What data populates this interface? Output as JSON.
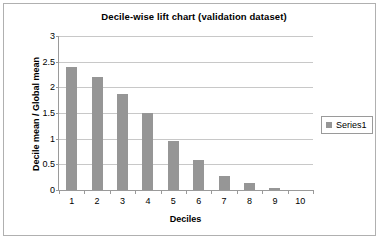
{
  "chart_data": {
    "type": "bar",
    "title": "Decile-wise lift chart (validation dataset)",
    "xlabel": "Deciles",
    "ylabel": "Decile mean / Global mean",
    "categories": [
      "1",
      "2",
      "3",
      "4",
      "5",
      "6",
      "7",
      "8",
      "9",
      "10"
    ],
    "values": [
      2.4,
      2.2,
      1.87,
      1.5,
      0.95,
      0.58,
      0.27,
      0.13,
      0.04,
      0.0
    ],
    "series": [
      {
        "name": "Series1",
        "values": [
          2.4,
          2.2,
          1.87,
          1.5,
          0.95,
          0.58,
          0.27,
          0.13,
          0.04,
          0.0
        ]
      }
    ],
    "ylim": [
      0,
      3
    ],
    "y_ticks": [
      "0",
      "0.5",
      "1",
      "1.5",
      "2",
      "2.5",
      "3"
    ],
    "y_tick_values": [
      0,
      0.5,
      1,
      1.5,
      2,
      2.5,
      3
    ],
    "grid": true,
    "legend_position": "right",
    "legend_entries": [
      "Series1"
    ],
    "bar_color": "#969696",
    "gridline_color": "#c8c8c8",
    "axis_color": "#9a9a9a",
    "plot_background": "#ffffff"
  },
  "legend": {
    "series1_label": "Series1"
  }
}
